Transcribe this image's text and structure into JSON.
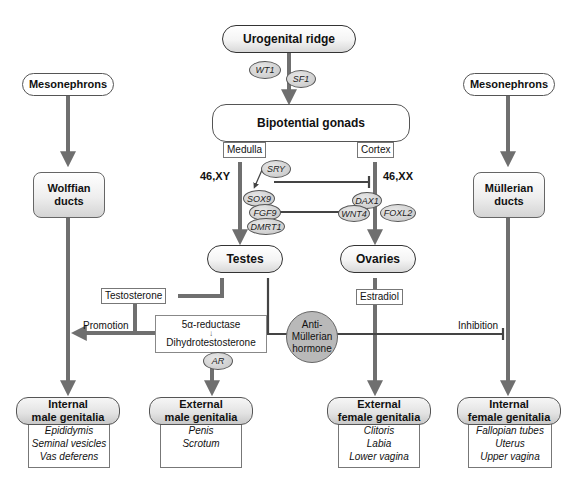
{
  "diagram": {
    "colors": {
      "arrow": "#6f6f6f",
      "inhibit": "#444444",
      "gene_fill": "#c8c8c8",
      "amh_fill": "#b9b9b9",
      "node_border": "#333333"
    },
    "nodes": {
      "urogenital_ridge": "Urogenital ridge",
      "bipotential_gonads": "Bipotential gonads",
      "medulla": "Medulla",
      "cortex": "Cortex",
      "karyotype_male": "46,XY",
      "karyotype_female": "46,XX",
      "testes": "Testes",
      "ovaries": "Ovaries",
      "mesonephrons_left": "Mesonephrons",
      "mesonephrons_right": "Mesonephrons",
      "wolffian_ducts": [
        "Wolffian",
        "ducts"
      ],
      "mullerian_ducts": [
        "Müllerian",
        "ducts"
      ],
      "testosterone": "Testosterone",
      "estradiol": "Estradiol",
      "reductase": "5α-reductase",
      "reductase_arrow": "↓",
      "dht": "Dihydrotestosterone",
      "amh": [
        "Anti-",
        "Müllerian",
        "hormone"
      ]
    },
    "genes": {
      "wt1": "WT1",
      "sf1": "SF1",
      "sry": "SRY",
      "sox9": "SOX9",
      "fgf9": "FGF9",
      "dmrt1": "DMRT1",
      "dax1": "DAX1",
      "wnt4": "WNT4",
      "foxl2": "FOXL2",
      "ar": "AR"
    },
    "edge_labels": {
      "promotion": "Promotion",
      "inhibition": "Inhibition"
    },
    "outcomes": [
      {
        "title": [
          "Internal",
          "male genitalia"
        ],
        "items": [
          "Epididymis",
          "Seminal vesicles",
          "Vas deferens"
        ]
      },
      {
        "title": [
          "External",
          "male genitalia"
        ],
        "items": [
          "Penis",
          "Scrotum"
        ]
      },
      {
        "title": [
          "External",
          "female genitalia"
        ],
        "items": [
          "Clitoris",
          "Labia",
          "Lower vagina"
        ]
      },
      {
        "title": [
          "Internal",
          "female genitalia"
        ],
        "items": [
          "Fallopian tubes",
          "Uterus",
          "Upper vagina"
        ]
      }
    ]
  }
}
